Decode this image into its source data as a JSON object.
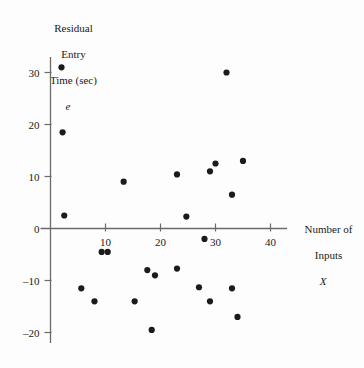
{
  "chart_data": {
    "type": "scatter",
    "title": "",
    "ylabel": "Residual Entry Time (sec)",
    "ylabel_lines": [
      "Residual",
      "Entry",
      "Time (sec)"
    ],
    "ylabel_symbol": "e",
    "xlabel": "Number of Inputs",
    "xlabel_lines": [
      "Number of",
      "Inputs"
    ],
    "xlabel_symbol": "X",
    "xlim": [
      0,
      43
    ],
    "ylim": [
      -22,
      33
    ],
    "xticks": [
      10,
      20,
      30,
      40
    ],
    "xtick_labels": [
      "10",
      "20",
      "30",
      "40"
    ],
    "yticks": [
      30,
      20,
      10,
      0,
      -10,
      -20
    ],
    "ytick_labels": [
      "30",
      "20",
      "10",
      "0",
      "–10",
      "–20"
    ],
    "grid": false,
    "legend": false,
    "marker": "filled-circle",
    "marker_color": "#1b1b1b",
    "axis_color": "#6b6b6b",
    "points": [
      {
        "x": 2.0,
        "y": 31.0
      },
      {
        "x": 32.0,
        "y": 30.0
      },
      {
        "x": 2.2,
        "y": 18.5
      },
      {
        "x": 35.0,
        "y": 13.0
      },
      {
        "x": 30.0,
        "y": 12.5
      },
      {
        "x": 29.0,
        "y": 11.0
      },
      {
        "x": 23.0,
        "y": 10.4
      },
      {
        "x": 13.3,
        "y": 9.0
      },
      {
        "x": 33.0,
        "y": 6.5
      },
      {
        "x": 24.7,
        "y": 2.3
      },
      {
        "x": 2.5,
        "y": 2.5
      },
      {
        "x": 28.0,
        "y": -2.0
      },
      {
        "x": 9.3,
        "y": -4.5
      },
      {
        "x": 10.4,
        "y": -4.5
      },
      {
        "x": 17.6,
        "y": -8.0
      },
      {
        "x": 23.0,
        "y": -7.7
      },
      {
        "x": 19.0,
        "y": -9.0
      },
      {
        "x": 5.6,
        "y": -11.5
      },
      {
        "x": 27.0,
        "y": -11.3
      },
      {
        "x": 33.0,
        "y": -11.5
      },
      {
        "x": 8.0,
        "y": -14.0
      },
      {
        "x": 15.3,
        "y": -14.0
      },
      {
        "x": 29.0,
        "y": -14.0
      },
      {
        "x": 34.0,
        "y": -17.0
      },
      {
        "x": 18.4,
        "y": -19.5
      }
    ]
  }
}
